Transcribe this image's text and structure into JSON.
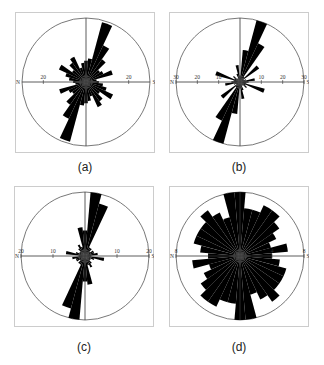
{
  "figure": {
    "captions": [
      "(a)",
      "(b)",
      "(c)",
      "(d)"
    ]
  },
  "style": {
    "fill": "#000000",
    "axis": "#333333",
    "circle": "#555555",
    "frame": "#cccccc"
  },
  "chart_data": [
    {
      "type": "rose",
      "caption": "(a)",
      "axis_labels": {
        "left_end": "N",
        "right_end": "S",
        "ticks_left": [
          "20"
        ],
        "ticks_right": [
          "20"
        ]
      },
      "rmax": 30,
      "bin_deg": 10,
      "directions_deg": [
        0,
        10,
        20,
        30,
        40,
        50,
        60,
        70,
        80,
        90,
        100,
        110,
        120,
        130,
        140,
        150,
        160,
        170
      ],
      "values": [
        10,
        11,
        29,
        19,
        13,
        8,
        9,
        13,
        5,
        6,
        8,
        10,
        14,
        8,
        11,
        13,
        7,
        9
      ]
    },
    {
      "type": "rose",
      "caption": "(b)",
      "axis_labels": {
        "left_end": "N",
        "right_end": "S",
        "ticks_left": [
          "30",
          "20",
          "10"
        ],
        "ticks_right": [
          "10",
          "20",
          "30"
        ]
      },
      "rmax": 30,
      "bin_deg": 10,
      "directions_deg": [
        0,
        10,
        20,
        30,
        40,
        50,
        60,
        70,
        80,
        90,
        100,
        110,
        120,
        130,
        140,
        150,
        160,
        170
      ],
      "values": [
        3,
        15,
        30,
        20,
        3,
        11,
        2,
        3,
        7,
        4,
        3,
        12,
        3,
        4,
        2,
        2,
        4,
        8
      ]
    },
    {
      "type": "rose",
      "caption": "(c)",
      "axis_labels": {
        "left_end": "N",
        "right_end": "S",
        "ticks_left": [
          "20",
          "10"
        ],
        "ticks_right": [
          "10",
          "20"
        ]
      },
      "rmax": 20,
      "bin_deg": 10,
      "directions_deg": [
        0,
        10,
        20,
        30,
        40,
        50,
        60,
        70,
        80,
        90,
        100,
        110,
        120,
        130,
        140,
        150,
        160,
        170
      ],
      "values": [
        8,
        20,
        17,
        3,
        3,
        2,
        3,
        3,
        4,
        2,
        6,
        3,
        2,
        2,
        3,
        4,
        3,
        9
      ]
    },
    {
      "type": "rose",
      "caption": "(d)",
      "axis_labels": {
        "left_end": "N",
        "right_end": "S",
        "ticks_left": [
          "8"
        ],
        "ticks_right": [
          "4",
          "8"
        ]
      },
      "rmax": 8,
      "bin_deg": 10,
      "directions_deg": [
        0,
        10,
        20,
        30,
        40,
        50,
        60,
        70,
        80,
        90,
        100,
        110,
        120,
        130,
        140,
        150,
        160,
        170
      ],
      "values": [
        8,
        6,
        6,
        7,
        7,
        6,
        5,
        4,
        6,
        4,
        5,
        6,
        6,
        6,
        7,
        6,
        5,
        8
      ]
    }
  ]
}
